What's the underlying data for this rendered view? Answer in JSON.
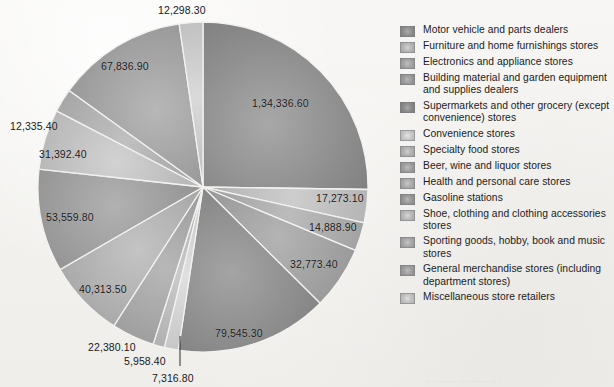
{
  "chart_data": {
    "type": "pie",
    "title": "",
    "subtitle": "",
    "xlabel": "",
    "ylabel": "",
    "legend_position": "right",
    "grid": false,
    "value_format": "indian-grouping",
    "total": 592052.5,
    "categories": [
      "Motor vehicle and parts dealers",
      "Furniture and home furnishings stores",
      "Electronics and appliance stores",
      "Building material and garden equipment and supplies dealers",
      "Supermarkets and other grocery (except convenience) stores",
      "Convenience stores",
      "Specialty food stores",
      "Beer, wine and liquor stores",
      "Health and personal care stores",
      "Gasoline stations",
      "Shoe, clothing and clothing accessories stores",
      "Sporting goods, hobby, book and music stores",
      "General merchandise stores (including department stores)",
      "Miscellaneous store retailers"
    ],
    "values": [
      134336.6,
      17273.1,
      14888.9,
      32773.4,
      79545.3,
      7316.8,
      5958.4,
      22380.1,
      40313.5,
      53559.8,
      31392.4,
      12335.4,
      67836.9,
      12298.3
    ],
    "labels": [
      "1,34,336.60",
      "17,273.10",
      "14,888.90",
      "32,773.40",
      "79,545.30",
      "7,316.80",
      "5,958.40",
      "22,380.10",
      "40,313.50",
      "53,559.80",
      "31,392.40",
      "12,335.40",
      "67,836.90",
      "12,298.30"
    ],
    "slice_colors": [
      "#8e8e8e",
      "#b4b4b4",
      "#a2a2a2",
      "#9a9a9a",
      "#8a8a8a",
      "#c6c6c6",
      "#b0b0b0",
      "#9e9e9e",
      "#aaaaaa",
      "#979797",
      "#b8b8b8",
      "#a6a6a6",
      "#9d9d9d",
      "#c0c0c0"
    ]
  },
  "legend": {
    "items": [
      {
        "label": "Motor vehicle and parts dealers",
        "color": "#8e8e8e"
      },
      {
        "label": "Furniture and home furnishings stores",
        "color": "#b4b4b4"
      },
      {
        "label": "Electronics and appliance stores",
        "color": "#a2a2a2"
      },
      {
        "label": "Building material and garden equipment and supplies dealers",
        "color": "#9a9a9a"
      },
      {
        "label": "Supermarkets and other grocery (except convenience) stores",
        "color": "#8a8a8a"
      },
      {
        "label": "Convenience stores",
        "color": "#c6c6c6"
      },
      {
        "label": "Specialty food stores",
        "color": "#b0b0b0"
      },
      {
        "label": "Beer, wine and liquor stores",
        "color": "#9e9e9e"
      },
      {
        "label": "Health and personal care stores",
        "color": "#aaaaaa"
      },
      {
        "label": "Gasoline stations",
        "color": "#979797"
      },
      {
        "label": "Shoe, clothing and clothing accessories stores",
        "color": "#b8b8b8"
      },
      {
        "label": "Sporting goods, hobby, book and music stores",
        "color": "#a6a6a6"
      },
      {
        "label": "General merchandise stores (including department stores)",
        "color": "#9d9d9d"
      },
      {
        "label": "Miscellaneous store retailers",
        "color": "#c0c0c0"
      }
    ]
  },
  "pie_geometry": {
    "center_x": 203,
    "center_y": 187,
    "radius": 165,
    "start_angle_deg": -90
  },
  "label_positions": [
    {
      "key": "1,34,336.60",
      "x": 252,
      "y": 97,
      "align": "left"
    },
    {
      "key": "17,273.10",
      "x": 316,
      "y": 192,
      "align": "left"
    },
    {
      "key": "14,888.90",
      "x": 309,
      "y": 221,
      "align": "left"
    },
    {
      "key": "32,773.40",
      "x": 290,
      "y": 258,
      "align": "left"
    },
    {
      "key": "79,545.30",
      "x": 215,
      "y": 327,
      "align": "left"
    },
    {
      "key": "7,316.80",
      "x": 152,
      "y": 372,
      "align": "left"
    },
    {
      "key": "5,958.40",
      "x": 124,
      "y": 355,
      "align": "left"
    },
    {
      "key": "22,380.10",
      "x": 88,
      "y": 341,
      "align": "left"
    },
    {
      "key": "40,313.50",
      "x": 79,
      "y": 283,
      "align": "left"
    },
    {
      "key": "53,559.80",
      "x": 46,
      "y": 211,
      "align": "left"
    },
    {
      "key": "31,392.40",
      "x": 39,
      "y": 148,
      "align": "left"
    },
    {
      "key": "12,335.40",
      "x": 10,
      "y": 120,
      "align": "left"
    },
    {
      "key": "67,836.90",
      "x": 101,
      "y": 60,
      "align": "left"
    },
    {
      "key": "12,298.30",
      "x": 158,
      "y": 4,
      "align": "left"
    }
  ],
  "bleed_text": "·  ·· ·     ···  ··· ··· ···· ·· ·· ·"
}
